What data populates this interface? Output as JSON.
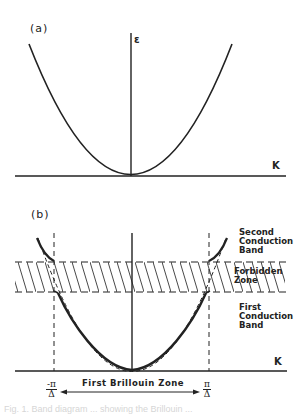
{
  "panel_a": {
    "label": "(a)",
    "y_axis_label": "ε",
    "x_axis_label": "K",
    "description": "Free-electron parabolic dispersion E vs K"
  },
  "panel_b": {
    "label": "(b)",
    "x_axis_label": "K",
    "bands": {
      "second": [
        "Second",
        "Conduction",
        "Band"
      ],
      "forbidden": [
        "Forbidden",
        "Zone"
      ],
      "first": [
        "First",
        "Conduction",
        "Band"
      ]
    },
    "left_boundary": {
      "num": "-π",
      "den": "Δ"
    },
    "right_boundary": {
      "num": "π",
      "den": "Δ"
    },
    "zone_label": "First Brillouin Zone"
  },
  "caption": "Fig. 1. Band diagram ... showing the Brillouin ..."
}
